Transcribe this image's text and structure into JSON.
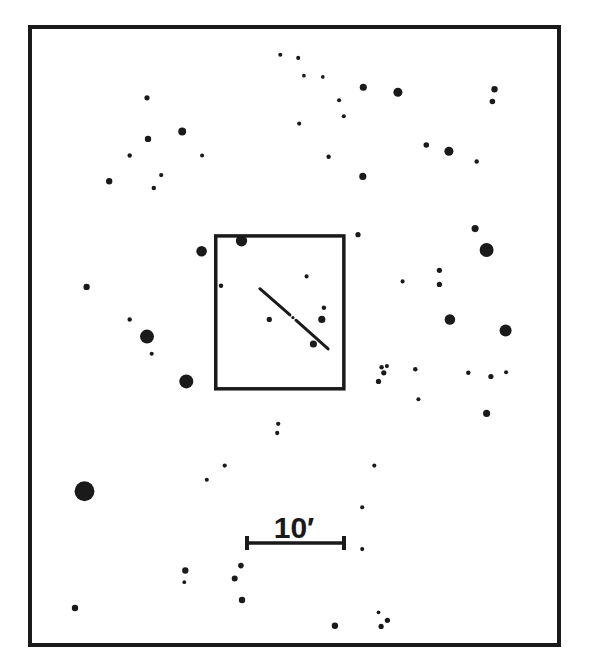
{
  "chart": {
    "ink_color": "#1a1a1a",
    "background": "#ffffff"
  },
  "scale_bar": {
    "label": "10′",
    "length_arcmin": 10
  },
  "field_of_view": {
    "label": "detail field"
  },
  "chart_data": {
    "type": "scatter",
    "title": "",
    "xlabel": "",
    "ylabel": "",
    "grid": false,
    "note": "Star positions in chart coordinates (0-100 horizontal, 0-100 vertical from top); mag_size is relative symbol size (1 = faintest, 10 = brightest).",
    "stars": [
      {
        "x": 47.3,
        "y": 4.2,
        "mag_size": 1.2
      },
      {
        "x": 50.7,
        "y": 4.7,
        "mag_size": 1.2
      },
      {
        "x": 51.8,
        "y": 7.6,
        "mag_size": 1
      },
      {
        "x": 55.4,
        "y": 7.8,
        "mag_size": 1
      },
      {
        "x": 63.1,
        "y": 9.5,
        "mag_size": 2.8
      },
      {
        "x": 69.7,
        "y": 10.3,
        "mag_size": 3.8
      },
      {
        "x": 88.1,
        "y": 9.8,
        "mag_size": 2.4
      },
      {
        "x": 87.7,
        "y": 11.8,
        "mag_size": 2
      },
      {
        "x": 21.9,
        "y": 11.2,
        "mag_size": 1.8
      },
      {
        "x": 58.5,
        "y": 11.6,
        "mag_size": 1.2
      },
      {
        "x": 59.4,
        "y": 14.2,
        "mag_size": 1.2
      },
      {
        "x": 50.9,
        "y": 15.4,
        "mag_size": 1.2
      },
      {
        "x": 28.6,
        "y": 16.7,
        "mag_size": 3.2
      },
      {
        "x": 22.1,
        "y": 17.9,
        "mag_size": 2.4
      },
      {
        "x": 75.1,
        "y": 18.9,
        "mag_size": 2
      },
      {
        "x": 79.4,
        "y": 19.9,
        "mag_size": 3.8
      },
      {
        "x": 18.6,
        "y": 20.6,
        "mag_size": 1.4
      },
      {
        "x": 32.4,
        "y": 20.6,
        "mag_size": 1.2
      },
      {
        "x": 56.5,
        "y": 20.8,
        "mag_size": 1.4
      },
      {
        "x": 84.7,
        "y": 21.6,
        "mag_size": 1.4
      },
      {
        "x": 24.6,
        "y": 23.8,
        "mag_size": 1.3
      },
      {
        "x": 63.0,
        "y": 24.0,
        "mag_size": 2.8
      },
      {
        "x": 14.7,
        "y": 24.8,
        "mag_size": 2.4
      },
      {
        "x": 23.2,
        "y": 25.9,
        "mag_size": 1.4
      },
      {
        "x": 84.4,
        "y": 32.5,
        "mag_size": 2.8
      },
      {
        "x": 62.1,
        "y": 33.5,
        "mag_size": 1.8
      },
      {
        "x": 39.9,
        "y": 34.5,
        "mag_size": 5
      },
      {
        "x": 32.3,
        "y": 36.2,
        "mag_size": 4.6
      },
      {
        "x": 86.6,
        "y": 36.0,
        "mag_size": 6.4
      },
      {
        "x": 36.0,
        "y": 41.8,
        "mag_size": 1.4
      },
      {
        "x": 77.6,
        "y": 39.3,
        "mag_size": 1.8
      },
      {
        "x": 52.3,
        "y": 40.3,
        "mag_size": 1.2
      },
      {
        "x": 70.6,
        "y": 41.1,
        "mag_size": 1.2
      },
      {
        "x": 77.6,
        "y": 41.6,
        "mag_size": 1.8
      },
      {
        "x": 10.4,
        "y": 42.0,
        "mag_size": 2.4
      },
      {
        "x": 55.6,
        "y": 45.4,
        "mag_size": 1.4
      },
      {
        "x": 18.6,
        "y": 47.3,
        "mag_size": 1.4
      },
      {
        "x": 45.2,
        "y": 47.3,
        "mag_size": 1.8
      },
      {
        "x": 55.2,
        "y": 47.3,
        "mag_size": 2.8
      },
      {
        "x": 79.6,
        "y": 47.3,
        "mag_size": 4.6
      },
      {
        "x": 90.2,
        "y": 49.1,
        "mag_size": 5.4
      },
      {
        "x": 21.9,
        "y": 50.1,
        "mag_size": 6.4
      },
      {
        "x": 53.6,
        "y": 51.3,
        "mag_size": 2.8
      },
      {
        "x": 22.8,
        "y": 52.9,
        "mag_size": 1.2
      },
      {
        "x": 66.6,
        "y": 55.1,
        "mag_size": 1.4
      },
      {
        "x": 67.6,
        "y": 54.9,
        "mag_size": 1.2
      },
      {
        "x": 67.0,
        "y": 56.0,
        "mag_size": 1.8
      },
      {
        "x": 66.0,
        "y": 57.4,
        "mag_size": 1.8
      },
      {
        "x": 73.0,
        "y": 55.4,
        "mag_size": 1.4
      },
      {
        "x": 83.1,
        "y": 56.0,
        "mag_size": 1.4
      },
      {
        "x": 87.4,
        "y": 56.6,
        "mag_size": 1.8
      },
      {
        "x": 90.3,
        "y": 55.9,
        "mag_size": 1.2
      },
      {
        "x": 29.4,
        "y": 57.4,
        "mag_size": 6.4
      },
      {
        "x": 73.6,
        "y": 60.3,
        "mag_size": 1.2
      },
      {
        "x": 86.6,
        "y": 62.6,
        "mag_size": 2.8
      },
      {
        "x": 46.9,
        "y": 64.3,
        "mag_size": 1.3
      },
      {
        "x": 46.7,
        "y": 65.8,
        "mag_size": 1.3
      },
      {
        "x": 36.7,
        "y": 71.1,
        "mag_size": 1.3
      },
      {
        "x": 33.3,
        "y": 73.4,
        "mag_size": 1.2
      },
      {
        "x": 65.2,
        "y": 71.1,
        "mag_size": 1.2
      },
      {
        "x": 10.0,
        "y": 75.3,
        "mag_size": 9.5
      },
      {
        "x": 62.9,
        "y": 77.9,
        "mag_size": 1.2
      },
      {
        "x": 62.9,
        "y": 84.7,
        "mag_size": 1.2
      },
      {
        "x": 29.2,
        "y": 88.2,
        "mag_size": 2.4
      },
      {
        "x": 29.0,
        "y": 90.1,
        "mag_size": 1
      },
      {
        "x": 39.8,
        "y": 87.4,
        "mag_size": 2
      },
      {
        "x": 38.6,
        "y": 89.5,
        "mag_size": 2.2
      },
      {
        "x": 40.0,
        "y": 93.0,
        "mag_size": 2.4
      },
      {
        "x": 8.2,
        "y": 94.3,
        "mag_size": 2.4
      },
      {
        "x": 57.7,
        "y": 97.2,
        "mag_size": 2.4
      },
      {
        "x": 66.0,
        "y": 95.0,
        "mag_size": 1
      },
      {
        "x": 67.7,
        "y": 96.3,
        "mag_size": 1.8
      },
      {
        "x": 66.5,
        "y": 97.3,
        "mag_size": 1.8
      }
    ],
    "galaxy": {
      "label": "galaxy (edge-on)",
      "x1": 43.4,
      "y1": 42.3,
      "x2": 56.4,
      "y2": 52.1,
      "nucleus_x": 49.7,
      "nucleus_y": 47.0
    },
    "detail_box": {
      "x0": 35.0,
      "y0": 33.7,
      "x1": 59.4,
      "y1": 58.6
    }
  }
}
